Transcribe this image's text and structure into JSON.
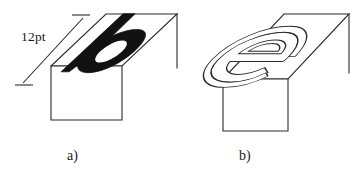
{
  "figure": {
    "background_color": "#ffffff",
    "ink_color": "#2b2b2b",
    "glyph_fill_color": "#111111",
    "dimension": {
      "label": "12pt",
      "name": "type-height-dimension"
    },
    "panels": [
      {
        "id": "a",
        "caption": "a)",
        "glyph": "b",
        "glyph_style": "solid-black-filled",
        "description": "Rectangular type block in oblique projection with a solid black letter b on its top face"
      },
      {
        "id": "b",
        "caption": "b)",
        "glyph": "e",
        "glyph_style": "outline-relief",
        "description": "Rectangular type block in oblique projection with an outlined relief letter e on its top face"
      }
    ]
  }
}
